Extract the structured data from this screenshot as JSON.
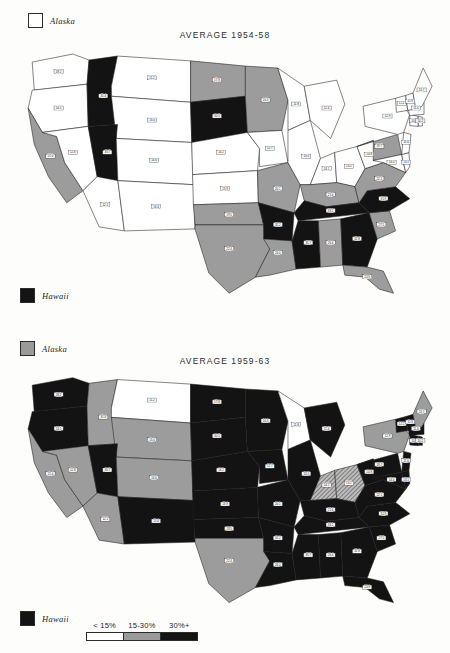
{
  "document": {
    "kind": "two-panel-choropleth-map-figure",
    "page_background": "#fdfdfc"
  },
  "colors": {
    "low": "#ffffff",
    "mid": "#9c9c9c",
    "high": "#131313",
    "outline": "#1f1f1f",
    "text": "#1e1e1e"
  },
  "panels": [
    {
      "id": "panel-1",
      "title": "AVERAGE 1954-58",
      "alaska_legend": {
        "label": "Alaska",
        "swatch": "white"
      },
      "hawaii_legend": {
        "label": "Hawaii",
        "swatch": "black"
      }
    },
    {
      "id": "panel-2",
      "title": "AVERAGE 1959-63",
      "alaska_legend": {
        "label": "Alaska",
        "swatch": "gray"
      },
      "hawaii_legend": {
        "label": "Hawaii",
        "swatch": "black"
      }
    }
  ],
  "scale_legend": {
    "labels": [
      "< 15%",
      "15-30%",
      "30%+"
    ],
    "swatches": [
      "white",
      "gray",
      "black"
    ]
  },
  "chart_data": {
    "type": "heatmap",
    "legend_position": "bottom-left",
    "categories": [
      "< 15%",
      "15-30%",
      "30%+"
    ],
    "series": [
      {
        "name": "AVERAGE 1954-58",
        "values": {
          "WA": "< 15%",
          "OR": "< 15%",
          "CA": "15-30%",
          "NV": "< 15%",
          "ID": "30%+",
          "UT": "30%+",
          "AZ": "< 15%",
          "MT": "< 15%",
          "WY": "< 15%",
          "CO": "< 15%",
          "NM": "< 15%",
          "ND": "15-30%",
          "SD": "30%+",
          "NE": "< 15%",
          "KS": "< 15%",
          "OK": "15-30%",
          "TX": "15-30%",
          "MN": "15-30%",
          "IA": "< 15%",
          "MO": "15-30%",
          "AR": "30%+",
          "LA": "15-30%",
          "WI": "< 15%",
          "IL": "< 15%",
          "MI": "< 15%",
          "IN": "< 15%",
          "OH": "< 15%",
          "KY": "15-30%",
          "TN": "30%+",
          "MS": "30%+",
          "AL": "15-30%",
          "GA": "30%+",
          "FL": "15-30%",
          "SC": "15-30%",
          "NC": "30%+",
          "VA": "15-30%",
          "WV": "< 15%",
          "PA": "15-30%",
          "NY": "< 15%",
          "MD": "< 15%",
          "DE": "< 15%",
          "NJ": "< 15%",
          "CT": "< 15%",
          "RI": "< 15%",
          "MA": "< 15%",
          "VT": "< 15%",
          "NH": "< 15%",
          "ME": "< 15%",
          "AK": "< 15%",
          "HI": "30%+"
        }
      },
      {
        "name": "AVERAGE 1959-63",
        "values": {
          "WA": "30%+",
          "OR": "30%+",
          "CA": "15-30%",
          "NV": "15-30%",
          "ID": "15-30%",
          "UT": "30%+",
          "AZ": "15-30%",
          "MT": "< 15%",
          "WY": "15-30%",
          "CO": "15-30%",
          "NM": "30%+",
          "ND": "30%+",
          "SD": "30%+",
          "NE": "30%+",
          "KS": "30%+",
          "OK": "30%+",
          "TX": "15-30%",
          "MN": "30%+",
          "IA": "30%+",
          "MO": "30%+",
          "AR": "30%+",
          "LA": "30%+",
          "WI": "< 15%",
          "IL": "30%+",
          "MI": "30%+",
          "IN": "15-30%",
          "OH": "15-30%",
          "KY": "30%+",
          "TN": "30%+",
          "MS": "30%+",
          "AL": "30%+",
          "GA": "30%+",
          "FL": "30%+",
          "SC": "30%+",
          "NC": "30%+",
          "VA": "30%+",
          "WV": "30%+",
          "PA": "30%+",
          "NY": "15-30%",
          "MD": "30%+",
          "DE": "30%+",
          "NJ": "30%+",
          "CT": "30%+",
          "RI": "30%+",
          "MA": "30%+",
          "VT": "30%+",
          "NH": "30%+",
          "ME": "15-30%",
          "AK": "15-30%",
          "HI": "30%+"
        }
      }
    ]
  }
}
